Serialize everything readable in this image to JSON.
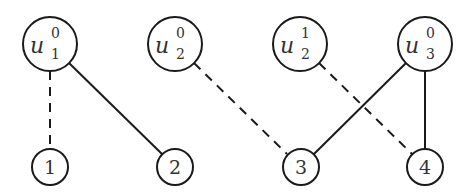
{
  "diagram": {
    "type": "bipartite-graph",
    "top_nodes": [
      {
        "id": "u1_0",
        "base": "u",
        "subscript": "1",
        "superscript": "0",
        "cx": 50,
        "cy": 44
      },
      {
        "id": "u2_0",
        "base": "u",
        "subscript": "2",
        "superscript": "0",
        "cx": 175,
        "cy": 44
      },
      {
        "id": "u2_1",
        "base": "u",
        "subscript": "2",
        "superscript": "1",
        "cx": 300,
        "cy": 44
      },
      {
        "id": "u3_0",
        "base": "u",
        "subscript": "3",
        "superscript": "0",
        "cx": 425,
        "cy": 44
      }
    ],
    "bottom_nodes": [
      {
        "id": "n1",
        "label": "1",
        "cx": 50,
        "cy": 167
      },
      {
        "id": "n2",
        "label": "2",
        "cx": 175,
        "cy": 167
      },
      {
        "id": "n3",
        "label": "3",
        "cx": 301,
        "cy": 167
      },
      {
        "id": "n4",
        "label": "4",
        "cx": 425,
        "cy": 167
      }
    ],
    "edges": [
      {
        "from": "u1_0",
        "to": "n1",
        "style": "dashed"
      },
      {
        "from": "u1_0",
        "to": "n2",
        "style": "solid"
      },
      {
        "from": "u2_0",
        "to": "n3",
        "style": "dashed"
      },
      {
        "from": "u2_1",
        "to": "n4",
        "style": "dashed"
      },
      {
        "from": "u3_0",
        "to": "n3",
        "style": "solid"
      },
      {
        "from": "u3_0",
        "to": "n4",
        "style": "solid"
      }
    ],
    "colors": {
      "stroke": "#1a1a1a",
      "text": "#333333",
      "background": "#ffffff"
    }
  }
}
